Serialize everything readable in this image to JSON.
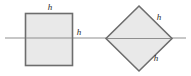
{
  "figure": {
    "background_color": "#ffffff",
    "shape_fill_color": "#e9e9e9",
    "shape_stroke_color": "#6d6d6d",
    "axis_color": "#8f8f8f",
    "label_color": "#2b2b2b",
    "shapes": [
      {
        "name": "square",
        "kind": "axis-aligned-square",
        "labels": [
          {
            "id": "square-top-label",
            "text": "h",
            "x": 50,
            "y": 8
          },
          {
            "id": "square-right-label",
            "text": "h",
            "x": 79,
            "y": 33
          }
        ]
      },
      {
        "name": "diamond",
        "kind": "rotated-square",
        "labels": [
          {
            "id": "diamond-upper-right-label",
            "text": "h",
            "x": 159,
            "y": 18
          },
          {
            "id": "diamond-lower-right-label",
            "text": "h",
            "x": 156,
            "y": 59
          }
        ]
      }
    ],
    "axis": {
      "name": "horizontal-axis",
      "x_start": 5,
      "x_end": 186,
      "y": 38
    }
  }
}
